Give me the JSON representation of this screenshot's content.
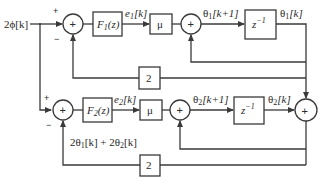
{
  "diagram": {
    "type": "block-diagram",
    "input": {
      "label": "2ϕ[k]"
    },
    "upper_branch": {
      "summer_in": {
        "plus": "+",
        "minus": "−",
        "symbol": "+"
      },
      "filter": {
        "name": "F",
        "sub": "1",
        "arg": "(z)"
      },
      "error": {
        "name": "e",
        "sub": "1",
        "arg": "[k]"
      },
      "gain_mu": "μ",
      "accumulator": {
        "symbol": "+"
      },
      "next_state": {
        "name": "θ",
        "sub": "1",
        "arg": "[k+1]"
      },
      "delay": {
        "base": "z",
        "exp": "−1"
      },
      "state": {
        "name": "θ",
        "sub": "1",
        "arg": "[k]"
      },
      "feedback_gain": "2"
    },
    "lower_branch": {
      "summer_in": {
        "plus": "+",
        "minus": "−",
        "symbol": "+"
      },
      "filter": {
        "name": "F",
        "sub": "2",
        "arg": "(z)"
      },
      "error": {
        "name": "e",
        "sub": "2",
        "arg": "[k]"
      },
      "gain_mu": "μ",
      "accumulator": {
        "symbol": "+"
      },
      "next_state": {
        "name": "θ",
        "sub": "2",
        "arg": "[k+1]"
      },
      "delay": {
        "base": "z",
        "exp": "−1"
      },
      "state": {
        "name": "θ",
        "sub": "2",
        "arg": "[k]"
      },
      "feedback_gain": "2",
      "feedback_label": {
        "p1": "2θ",
        "s1": "1",
        "a1": "[k] + 2θ",
        "s2": "2",
        "a2": "[k]"
      }
    },
    "output_summer": {
      "symbol": "+"
    }
  }
}
